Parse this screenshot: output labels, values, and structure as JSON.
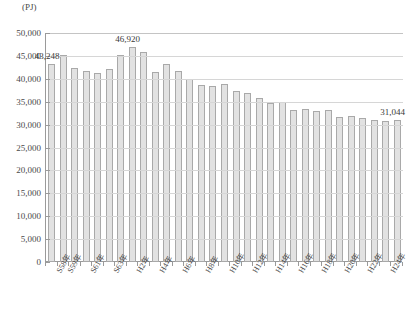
{
  "chart_data": {
    "type": "bar",
    "title": "",
    "unit_label": "(PJ)",
    "xlabel": "",
    "ylabel": "",
    "ylim": [
      0,
      50000
    ],
    "ytick_step": 5000,
    "grid": true,
    "legend": "none",
    "categories": [
      "S58年",
      "S59年",
      "S60年",
      "S61年",
      "S62年",
      "S63年",
      "H元年",
      "H2年",
      "H3年",
      "H4年",
      "H5年",
      "H6年",
      "H7年",
      "H8年",
      "H9年",
      "H10年",
      "H11年",
      "H12年",
      "H13年",
      "H14年",
      "H15年",
      "H16年",
      "H17年",
      "H18年",
      "H19年",
      "H20年",
      "H21年",
      "H22年",
      "H23年",
      "H24年",
      "H25年"
    ],
    "values": [
      43248,
      45230,
      42300,
      41800,
      41200,
      42100,
      45100,
      46920,
      45800,
      41500,
      43300,
      41600,
      40000,
      38600,
      38500,
      38800,
      37400,
      37000,
      35900,
      34800,
      34900,
      33100,
      33500,
      32900,
      33200,
      31600,
      31800,
      31400,
      30900,
      30800,
      31044
    ],
    "ytick_labels": [
      "50,000",
      "45,000",
      "40,000",
      "35,000",
      "30,000",
      "25,000",
      "20,000",
      "15,000",
      "10,000",
      "5,000",
      "0"
    ],
    "callouts": [
      {
        "label": "43,248",
        "index": 0
      },
      {
        "label": "46,920",
        "index": 7
      },
      {
        "label": "31,044",
        "index": 30
      }
    ],
    "xtick_label_indices": [
      0,
      1,
      2,
      3,
      4,
      5,
      6,
      7,
      8,
      9,
      10,
      11,
      12,
      13,
      14,
      15,
      16,
      17,
      18,
      19,
      20,
      21,
      22,
      23,
      24,
      25,
      26,
      27,
      28,
      29,
      30
    ],
    "xtick_visible_labels": [
      {
        "index": 0,
        "text": "S58年"
      },
      {
        "index": 1,
        "text": "S59年"
      },
      {
        "index": 3,
        "text": "S61年"
      },
      {
        "index": 5,
        "text": "S63年"
      },
      {
        "index": 7,
        "text": "H2年"
      },
      {
        "index": 9,
        "text": "H4年"
      },
      {
        "index": 11,
        "text": "H6年"
      },
      {
        "index": 13,
        "text": "H8年"
      },
      {
        "index": 15,
        "text": "H10年"
      },
      {
        "index": 17,
        "text": "H12年"
      },
      {
        "index": 19,
        "text": "H14年"
      },
      {
        "index": 21,
        "text": "H16年"
      },
      {
        "index": 23,
        "text": "H18年"
      },
      {
        "index": 25,
        "text": "H20年"
      },
      {
        "index": 27,
        "text": "H22年"
      },
      {
        "index": 29,
        "text": "H24年"
      }
    ],
    "colors": {
      "bar_fill": "#e2e2e2",
      "bar_border": "#a9a9a9",
      "gridline": "#d6d6d6",
      "axis": "#9a9a9a",
      "text": "#3a3a3a"
    }
  }
}
